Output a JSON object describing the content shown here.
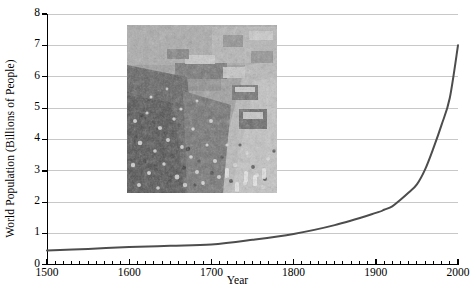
{
  "chart_data": {
    "type": "line",
    "title": "",
    "xlabel": "Year",
    "ylabel": "World Population (Billions of People)",
    "xlim": [
      1500,
      2000
    ],
    "ylim": [
      0,
      8
    ],
    "xticks": [
      1500,
      1600,
      1700,
      1800,
      1900,
      2000
    ],
    "xtick_labels": [
      "1500",
      "1600",
      "1700",
      "1800",
      "1900",
      "2000"
    ],
    "minor_xtick_interval": 10,
    "yticks": [
      0,
      1,
      2,
      3,
      4,
      5,
      6,
      7,
      8
    ],
    "ytick_labels": [
      "0",
      "1",
      "2",
      "3",
      "4",
      "5",
      "6",
      "7",
      "8"
    ],
    "grid": "horizontal",
    "grid_color": "#c8c8c8",
    "legend": "none",
    "line_color": "#4d4d4d",
    "line_width": 2,
    "series": [
      {
        "name": "World Population",
        "x": [
          1500,
          1550,
          1600,
          1650,
          1700,
          1750,
          1800,
          1850,
          1900,
          1910,
          1920,
          1930,
          1940,
          1950,
          1960,
          1970,
          1980,
          1990,
          2000
        ],
        "values": [
          0.45,
          0.5,
          0.56,
          0.6,
          0.64,
          0.79,
          0.98,
          1.26,
          1.65,
          1.75,
          1.86,
          2.07,
          2.3,
          2.56,
          3.04,
          3.71,
          4.46,
          5.32,
          7.0
        ]
      }
    ],
    "annotations": [
      {
        "type": "inset-image",
        "name": "crowded-street-photograph",
        "description": "Black-and-white aerial photograph of a dense crowd filling a city street with buses and market stalls",
        "x_px": 127,
        "y_px": 25,
        "width_px": 150,
        "height_px": 168
      }
    ]
  },
  "axis_titles": {
    "x": "Year",
    "y": "World Population (Billions of People)"
  }
}
